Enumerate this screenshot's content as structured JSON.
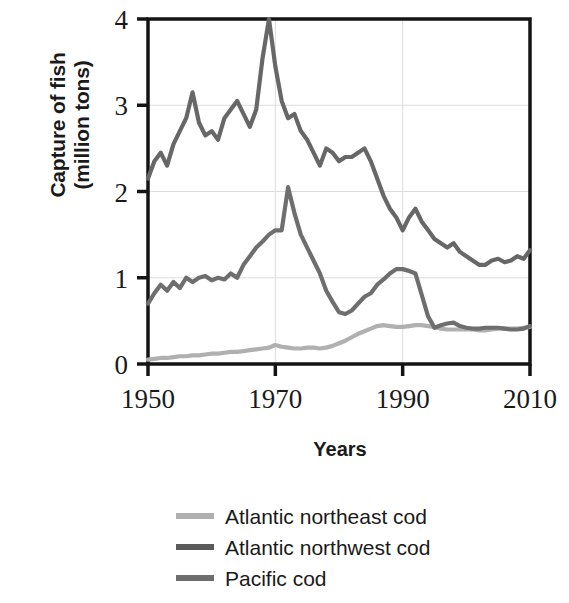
{
  "chart_data": {
    "type": "line",
    "title": "",
    "xlabel": "Years",
    "ylabel": "Capture of fish\n(million tons)",
    "xlim": [
      1950,
      2010
    ],
    "ylim": [
      0,
      4
    ],
    "xticks": [
      1950,
      1970,
      1990,
      2010
    ],
    "yticks": [
      0,
      1,
      2,
      3,
      4
    ],
    "xtick_labels": [
      "1950",
      "1970",
      "1990",
      "2010"
    ],
    "ytick_labels": [
      "0",
      "1",
      "2",
      "3",
      "4"
    ],
    "grid": true,
    "legend_position": "below",
    "x": [
      1950,
      1951,
      1952,
      1953,
      1954,
      1955,
      1956,
      1957,
      1958,
      1959,
      1960,
      1961,
      1962,
      1963,
      1964,
      1965,
      1966,
      1967,
      1968,
      1969,
      1970,
      1971,
      1972,
      1973,
      1974,
      1975,
      1976,
      1977,
      1978,
      1979,
      1980,
      1981,
      1982,
      1983,
      1984,
      1985,
      1986,
      1987,
      1988,
      1989,
      1990,
      1991,
      1992,
      1993,
      1994,
      1995,
      1996,
      1997,
      1998,
      1999,
      2000,
      2001,
      2002,
      2003,
      2004,
      2005,
      2006,
      2007,
      2008,
      2009,
      2010
    ],
    "series": [
      {
        "name": "Atlantic northeast cod",
        "color": "#b0b0b0",
        "values": [
          0.05,
          0.06,
          0.07,
          0.07,
          0.08,
          0.09,
          0.09,
          0.1,
          0.1,
          0.11,
          0.12,
          0.12,
          0.13,
          0.14,
          0.14,
          0.15,
          0.16,
          0.17,
          0.18,
          0.19,
          0.22,
          0.2,
          0.19,
          0.18,
          0.18,
          0.19,
          0.19,
          0.18,
          0.19,
          0.21,
          0.24,
          0.27,
          0.31,
          0.35,
          0.38,
          0.41,
          0.44,
          0.45,
          0.44,
          0.43,
          0.43,
          0.44,
          0.45,
          0.45,
          0.44,
          0.43,
          0.41,
          0.4,
          0.4,
          0.4,
          0.4,
          0.4,
          0.39,
          0.39,
          0.4,
          0.41,
          0.41,
          0.41,
          0.41,
          0.42,
          0.43
        ]
      },
      {
        "name": "Atlantic northwest cod",
        "color": "#676767",
        "values": [
          2.15,
          2.35,
          2.45,
          2.3,
          2.55,
          2.7,
          2.85,
          3.15,
          2.8,
          2.65,
          2.7,
          2.6,
          2.85,
          2.95,
          3.05,
          2.9,
          2.75,
          2.95,
          3.55,
          4.0,
          3.45,
          3.05,
          2.85,
          2.9,
          2.7,
          2.6,
          2.45,
          2.3,
          2.5,
          2.45,
          2.35,
          2.4,
          2.4,
          2.45,
          2.5,
          2.35,
          2.15,
          1.95,
          1.8,
          1.7,
          1.55,
          1.7,
          1.8,
          1.65,
          1.55,
          1.45,
          1.4,
          1.35,
          1.4,
          1.3,
          1.25,
          1.2,
          1.15,
          1.15,
          1.2,
          1.22,
          1.18,
          1.2,
          1.25,
          1.22,
          1.32
        ]
      },
      {
        "name": "Pacific cod",
        "color": "#6e6e6e",
        "values": [
          0.7,
          0.82,
          0.92,
          0.85,
          0.95,
          0.88,
          1.0,
          0.95,
          1.0,
          1.02,
          0.97,
          1.0,
          0.98,
          1.05,
          1.0,
          1.15,
          1.25,
          1.35,
          1.42,
          1.5,
          1.55,
          1.55,
          2.05,
          1.75,
          1.5,
          1.35,
          1.2,
          1.05,
          0.85,
          0.72,
          0.6,
          0.58,
          0.62,
          0.7,
          0.78,
          0.82,
          0.92,
          0.98,
          1.05,
          1.1,
          1.1,
          1.08,
          1.05,
          0.8,
          0.55,
          0.42,
          0.45,
          0.47,
          0.48,
          0.44,
          0.42,
          0.41,
          0.41,
          0.42,
          0.42,
          0.42,
          0.41,
          0.4,
          0.4,
          0.41,
          0.44
        ]
      }
    ]
  },
  "legend": {
    "items": [
      {
        "label": "Atlantic northeast cod",
        "color": "#b0b0b0"
      },
      {
        "label": "Atlantic northwest cod",
        "color": "#5a5a5a"
      },
      {
        "label": "Pacific cod",
        "color": "#6e6e6e"
      }
    ]
  },
  "axes": {
    "x_title": "Years",
    "y_title": "Capture of fish\n(million tons)"
  },
  "colors": {
    "axis": "#141414",
    "grid": "#dcdcdc",
    "background": "#ffffff",
    "text": "#1a1a1a"
  }
}
